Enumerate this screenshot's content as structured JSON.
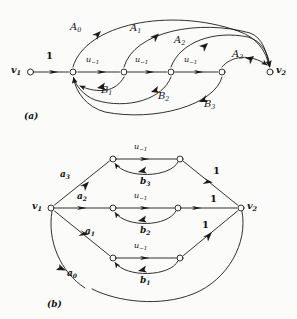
{
  "figure": {
    "title_a": "(a)",
    "title_b": "(b)",
    "stroke_color": "#1a1a1a",
    "background_color": "#fbfbfa"
  },
  "panel_a": {
    "caption": "(a)",
    "nodes": [
      {
        "id": "v1",
        "label": "v",
        "sub": "1",
        "x": 28,
        "y": 72
      },
      {
        "id": "n1",
        "label": "",
        "sub": "",
        "x": 73,
        "y": 72
      },
      {
        "id": "n2",
        "label": "",
        "sub": "",
        "x": 124,
        "y": 72
      },
      {
        "id": "n3",
        "label": "",
        "sub": "",
        "x": 171,
        "y": 72
      },
      {
        "id": "n4",
        "label": "",
        "sub": "",
        "x": 222,
        "y": 72
      },
      {
        "id": "v2",
        "label": "v",
        "sub": "2",
        "x": 270,
        "y": 72
      }
    ],
    "edge_labels": {
      "one": "1",
      "u_base": "u",
      "u_sub": "−1",
      "A": [
        "A",
        "A",
        "A",
        "A"
      ],
      "A_subs": [
        "0",
        "1",
        "2",
        "3"
      ],
      "B": [
        "B",
        "B",
        "B"
      ],
      "B_subs": [
        "1",
        "2",
        "3"
      ]
    },
    "labels": [
      {
        "name": "v1-label",
        "text": "v",
        "sub": "1",
        "x": 11,
        "y": 67
      },
      {
        "name": "v2-label",
        "text": "v",
        "sub": "2",
        "x": 276,
        "y": 67
      },
      {
        "name": "weight-1",
        "text": "1",
        "sub": "",
        "x": 47,
        "y": 53
      },
      {
        "name": "u-minus-1-a",
        "text": "u",
        "sub": "−1",
        "x": 88,
        "y": 58
      },
      {
        "name": "u-minus-1-b",
        "text": "u",
        "sub": "−1",
        "x": 137,
        "y": 58
      },
      {
        "name": "u-minus-1-c",
        "text": "u",
        "sub": "−1",
        "x": 186,
        "y": 58
      },
      {
        "name": "A0-label",
        "text": "A",
        "sub": "0",
        "x": 70,
        "y": 24
      },
      {
        "name": "A1-label",
        "text": "A",
        "sub": "1",
        "x": 130,
        "y": 25
      },
      {
        "name": "A2-label",
        "text": "A",
        "sub": "2",
        "x": 174,
        "y": 37
      },
      {
        "name": "A3-label",
        "text": "A",
        "sub": "3",
        "x": 232,
        "y": 51
      },
      {
        "name": "B1-label",
        "text": "B",
        "sub": "1",
        "x": 101,
        "y": 86
      },
      {
        "name": "B2-label",
        "text": "B",
        "sub": "2",
        "x": 158,
        "y": 92
      },
      {
        "name": "B3-label",
        "text": "B",
        "sub": "3",
        "x": 204,
        "y": 100
      }
    ]
  },
  "panel_b": {
    "caption": "(b)",
    "nodes": [
      {
        "id": "v1",
        "x": 51,
        "y": 208
      },
      {
        "id": "v2",
        "x": 241,
        "y": 208
      },
      {
        "id": "t1",
        "x": 113,
        "y": 159
      },
      {
        "id": "t2",
        "x": 180,
        "y": 159
      },
      {
        "id": "m1",
        "x": 113,
        "y": 208
      },
      {
        "id": "m2",
        "x": 178,
        "y": 208
      },
      {
        "id": "b1",
        "x": 113,
        "y": 258
      },
      {
        "id": "b2",
        "x": 180,
        "y": 258
      }
    ],
    "labels": [
      {
        "name": "v1-label",
        "text": "v",
        "sub": "1",
        "x": 33,
        "y": 203
      },
      {
        "name": "v2-label",
        "text": "v",
        "sub": "2",
        "x": 247,
        "y": 203
      },
      {
        "name": "a3-label",
        "text": "a",
        "sub": "3",
        "x": 61,
        "y": 172
      },
      {
        "name": "a2-label",
        "text": "a",
        "sub": "2",
        "x": 78,
        "y": 194
      },
      {
        "name": "a1-label",
        "text": "a",
        "sub": "1",
        "x": 86,
        "y": 229
      },
      {
        "name": "a0-label",
        "text": "a",
        "sub": "0",
        "x": 68,
        "y": 271
      },
      {
        "name": "u-minus-1-top",
        "text": "u",
        "sub": "−1",
        "x": 136,
        "y": 146
      },
      {
        "name": "u-minus-1-mid",
        "text": "u",
        "sub": "−1",
        "x": 136,
        "y": 195
      },
      {
        "name": "u-minus-1-bot",
        "text": "u",
        "sub": "−1",
        "x": 136,
        "y": 245
      },
      {
        "name": "b3-label",
        "text": "b",
        "sub": "3",
        "x": 141,
        "y": 180
      },
      {
        "name": "b2-label",
        "text": "b",
        "sub": "2",
        "x": 141,
        "y": 229
      },
      {
        "name": "b1-label",
        "text": "b",
        "sub": "1",
        "x": 141,
        "y": 279
      },
      {
        "name": "weight-1-top",
        "text": "1",
        "sub": "",
        "x": 213,
        "y": 168
      },
      {
        "name": "weight-1-mid",
        "text": "1",
        "sub": "",
        "x": 210,
        "y": 196
      },
      {
        "name": "weight-1-bot",
        "text": "1",
        "sub": "",
        "x": 202,
        "y": 222
      }
    ]
  }
}
